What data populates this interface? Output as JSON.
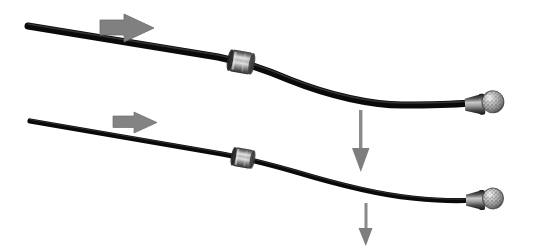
{
  "figure": {
    "caption": "Schematic photograph showing two catheter guidewires advancing to the right and deflecting downward",
    "background_color": "#ffffff",
    "width": 536,
    "height": 248
  },
  "colors": {
    "wire": "#0a0a0a",
    "wire_highlight": "#4a4a4a",
    "arrow_gray": "#808080",
    "arrow_gray_dark": "#6e6e6e",
    "bead_light": "#d8d8d8",
    "bead_mid": "#8f8f8f",
    "bead_dark": "#2a2a2a",
    "ferrule_dark": "#1c1c1c",
    "ferrule_mid": "#7a7a7a",
    "bulb_light": "#cfcfcf",
    "bulb_speckle": "#3a3a3a",
    "background": "#ffffff"
  },
  "devices": [
    {
      "id": "upper-device",
      "label": "Upper guidewire",
      "wire_thickness": 7,
      "start_point": {
        "x": 28,
        "y": 26
      },
      "bead": {
        "x": 241,
        "y": 62,
        "width": 24,
        "height": 22,
        "angle": 10,
        "label": "Upper sleeve bead"
      },
      "tip": {
        "x": 487,
        "y": 104,
        "label": "Upper bulb tip"
      },
      "path": "M28,26 L218,57 C238,61 262,68 290,80 C330,96 372,105 402,105 C432,105 458,104 470,103",
      "advance_arrow": {
        "x": 100,
        "y": 14,
        "width": 60,
        "height": 28,
        "direction": "right",
        "label": "Advance direction (upper)"
      },
      "deflect_arrow": {
        "x": 361,
        "y": 110,
        "length": 58,
        "direction": "down",
        "label": "Deflection direction (upper)"
      }
    },
    {
      "id": "lower-device",
      "label": "Lower guidewire",
      "wire_thickness": 5,
      "start_point": {
        "x": 30,
        "y": 121
      },
      "bead": {
        "x": 243,
        "y": 158,
        "width": 21,
        "height": 19,
        "angle": 10,
        "label": "Lower sleeve bead"
      },
      "tip": {
        "x": 487,
        "y": 200,
        "label": "Lower bulb tip"
      },
      "path": "M30,121 L222,154 C244,158 268,164 296,172 C336,184 382,195 412,198 C442,201 462,201 472,200",
      "advance_arrow": {
        "x": 113,
        "y": 112,
        "width": 44,
        "height": 20,
        "direction": "right",
        "label": "Advance direction (lower)"
      },
      "deflect_arrow": {
        "x": 366,
        "y": 203,
        "length": 42,
        "direction": "down",
        "label": "Deflection direction (lower)"
      }
    }
  ],
  "annotations": {
    "arrow_count": 4,
    "bead_count": 2,
    "tip_count": 2
  }
}
